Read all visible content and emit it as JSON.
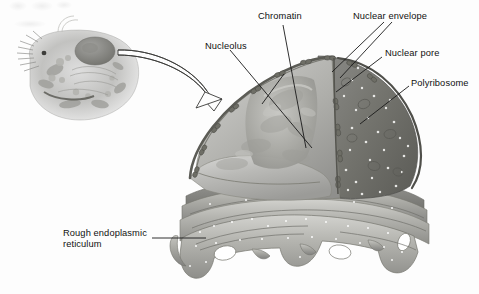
{
  "figure": {
    "style": "grayscale airbrush textbook illustration",
    "background_color": "#fdfdfd",
    "label_color": "#111111",
    "leader_line_color": "#1a1a1a"
  },
  "labels": {
    "chromatin": "Chromatin",
    "nuclear_envelope": "Nuclear envelope",
    "nucleolus": "Nucleolus",
    "nuclear_pore": "Nuclear pore",
    "polyribosome": "Polyribosome",
    "rough_er_line1": "Rough endoplasmic",
    "rough_er_line2": "reticulum"
  },
  "inset": {
    "name": "whole-cell-thumbnail",
    "description": "small grayscale drawing of an entire animal cell with microvilli, organelles and nucleus"
  },
  "arrow": {
    "name": "magnification-arrow",
    "style": "hollow outlined curved arrow",
    "from": "inset cell nucleus",
    "to": "enlarged nucleus diagram"
  },
  "structures": {
    "nucleus": "nucleus shown in cutaway revealing nucleoplasm and nucleolus",
    "outer_membrane": "dark outer nuclear membrane studded with ribosomes",
    "nuclear_pores": "paired bead-like pore structures along the envelope edge",
    "rough_er": "stacked folded membrane sheets with fenestrations below the nucleus"
  }
}
